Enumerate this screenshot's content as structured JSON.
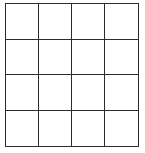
{
  "grid": {
    "rows": 4,
    "columns": 4,
    "line_color": "#2b2b2b",
    "cell_fill": "#ffffff",
    "cells": [
      [
        "",
        "",
        "",
        ""
      ],
      [
        "",
        "",
        "",
        ""
      ],
      [
        "",
        "",
        "",
        ""
      ],
      [
        "",
        "",
        "",
        ""
      ]
    ]
  }
}
